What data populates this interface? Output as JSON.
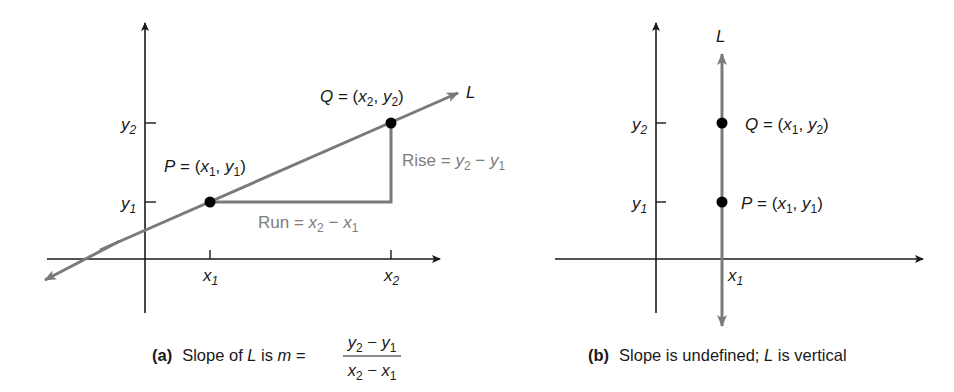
{
  "colors": {
    "axis": "#1a1a1a",
    "line": "#7a7a7a",
    "point": "#000000",
    "annotation": "#7d7d7d",
    "text": "#1a1a1a"
  },
  "panel_a": {
    "line_label": "L",
    "point_p": {
      "name": "P",
      "eq": " = (",
      "x": "x",
      "x_sub": "1",
      "sep": ", ",
      "y": "y",
      "y_sub": "1",
      "close": ")"
    },
    "point_q": {
      "name": "Q",
      "eq": " = (",
      "x": "x",
      "x_sub": "2",
      "sep": ", ",
      "y": "y",
      "y_sub": "2",
      "close": ")"
    },
    "rise_label": {
      "prefix": "Rise = ",
      "a": "y",
      "a_sub": "2",
      "minus": " − ",
      "b": "y",
      "b_sub": "1"
    },
    "run_label": {
      "prefix": "Run = ",
      "a": "x",
      "a_sub": "2",
      "minus": " − ",
      "b": "x",
      "b_sub": "1"
    },
    "x_ticks": [
      {
        "base": "x",
        "sub": "1"
      },
      {
        "base": "x",
        "sub": "2"
      }
    ],
    "y_ticks": [
      {
        "base": "y",
        "sub": "1"
      },
      {
        "base": "y",
        "sub": "2"
      }
    ],
    "caption": {
      "tag": "(a)",
      "text": "Slope of ",
      "L": "L",
      "is": " is ",
      "m": "m",
      "eq": " =",
      "numerator": {
        "a": "y",
        "a_sub": "2",
        "minus": " − ",
        "b": "y",
        "b_sub": "1"
      },
      "denominator": {
        "a": "x",
        "a_sub": "2",
        "minus": " − ",
        "b": "x",
        "b_sub": "1"
      }
    }
  },
  "panel_b": {
    "line_label": "L",
    "point_p": {
      "name": "P",
      "eq": " = (",
      "x": "x",
      "x_sub": "1",
      "sep": ", ",
      "y": "y",
      "y_sub": "1",
      "close": ")"
    },
    "point_q": {
      "name": "Q",
      "eq": " = (",
      "x": "x",
      "x_sub": "1",
      "sep": ", ",
      "y": "y",
      "y_sub": "2",
      "close": ")"
    },
    "x_ticks": [
      {
        "base": "x",
        "sub": "1"
      }
    ],
    "y_ticks": [
      {
        "base": "y",
        "sub": "1"
      },
      {
        "base": "y",
        "sub": "2"
      }
    ],
    "caption": {
      "tag": "(b)",
      "text1": "Slope is undefined; ",
      "L": "L",
      "text2": " is vertical"
    }
  }
}
